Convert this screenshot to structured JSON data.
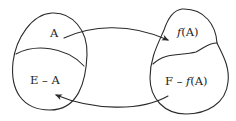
{
  "diagram": {
    "type": "set-mapping",
    "sets": [
      {
        "name": "E",
        "regions": [
          {
            "id": "A",
            "label": "A"
          },
          {
            "id": "E-A",
            "label_left": "E",
            "label_op": "–",
            "label_right": "A"
          }
        ]
      },
      {
        "name": "F",
        "regions": [
          {
            "id": "fA",
            "label_func": "f",
            "label_arg": "(A)"
          },
          {
            "id": "F-fA",
            "label_left": "F",
            "label_op": "–",
            "label_func": "f",
            "label_arg": "(A)"
          }
        ]
      }
    ],
    "arrows": [
      {
        "from": "A",
        "to": "fA"
      },
      {
        "from": "F-fA",
        "to": "E-A"
      }
    ],
    "colors": {
      "stroke": "#2a2a2a",
      "text": "#1e1e1e",
      "background": "#ffffff"
    }
  }
}
